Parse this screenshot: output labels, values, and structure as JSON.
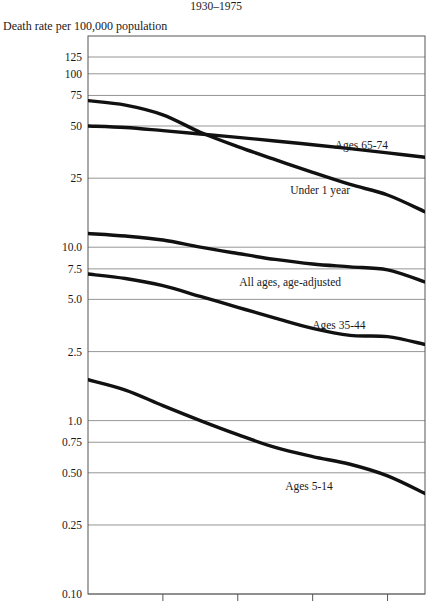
{
  "header": {
    "title": "1930–1975",
    "axis_caption": "Death rate per 100,000 population"
  },
  "chart_data": {
    "type": "line",
    "title": "1930–1975",
    "subtitle": "",
    "xlabel": "",
    "ylabel": "Death rate per 100,000 population",
    "yscale": "log",
    "ylim": [
      0.1,
      141
    ],
    "xlim": [
      1930,
      1975
    ],
    "grid": true,
    "legend_position": "inline-labels",
    "ytick_labels": [
      "125",
      "100",
      "75",
      "50",
      "25",
      "10.0",
      "7.5",
      "5.0",
      "2.5",
      "1.0",
      "0.75",
      "0.50",
      "0.25",
      "0.10"
    ],
    "ytick_values": [
      125,
      100,
      75,
      50,
      25,
      10.0,
      7.5,
      5.0,
      2.5,
      1.0,
      0.75,
      0.5,
      0.25,
      0.1
    ],
    "xtick_values": [
      1940,
      1950,
      1960,
      1970
    ],
    "xtick_labels": [
      "",
      "",
      "",
      ""
    ],
    "x": [
      1930,
      1935,
      1940,
      1945,
      1950,
      1955,
      1960,
      1965,
      1970,
      1975
    ],
    "series": [
      {
        "name": "Under 1 year",
        "label": "Under 1 year",
        "label_x": 1961.0,
        "label_y": 21.5,
        "values": [
          70,
          66,
          58,
          46,
          38,
          32,
          27,
          23,
          20,
          16
        ]
      },
      {
        "name": "Ages 65-74",
        "label": "Ages 65-74",
        "label_x": 1966.5,
        "label_y": 39.0,
        "values": [
          50,
          49,
          47,
          45,
          43,
          41,
          39,
          37,
          35,
          33
        ]
      },
      {
        "name": "All ages, age-adjusted",
        "label": "All ages,  age-adjusted",
        "label_x": 1957.0,
        "label_y": 6.3,
        "values": [
          12.0,
          11.6,
          11.0,
          10.0,
          9.2,
          8.5,
          8.0,
          7.7,
          7.4,
          6.3
        ]
      },
      {
        "name": "Ages 35-44",
        "label": "Ages 35-44",
        "label_x": 1963.5,
        "label_y": 3.55,
        "values": [
          7.0,
          6.6,
          6.0,
          5.2,
          4.5,
          3.9,
          3.4,
          3.1,
          3.05,
          2.75
        ]
      },
      {
        "name": "Ages 5-14",
        "label": "Ages 5-14",
        "label_x": 1959.5,
        "label_y": 0.42,
        "values": [
          1.72,
          1.5,
          1.22,
          1.0,
          0.83,
          0.7,
          0.62,
          0.56,
          0.48,
          0.38
        ]
      }
    ]
  },
  "colors": {
    "line": "#111111",
    "grid": "#8a8a8a",
    "frame": "#555555",
    "text": "#1a1a1a",
    "background": "#ffffff"
  },
  "geometry": {
    "plot_left": 88,
    "plot_right": 425,
    "plot_top": 36,
    "plot_bottom": 594
  }
}
